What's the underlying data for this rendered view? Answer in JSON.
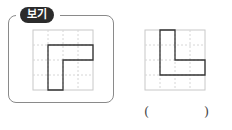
{
  "example_box": {
    "badge_label": "보기",
    "grid": {
      "cols": 4,
      "rows": 4,
      "cell_px": 15
    },
    "shape_cells_outline": "L-shape rotated: top bar spans cols 2-4 on row 2, vertical stem col 2 rows 2-4"
  },
  "question_figure": {
    "grid": {
      "cols": 4,
      "rows": 4,
      "cell_px": 15
    },
    "shape_cells_outline": "L-shape: vertical stem col 2 rows 1-3, bottom bar spans cols 2-4 on row 3"
  },
  "answer_blank": {
    "open_paren": "(",
    "close_paren": ")",
    "value": ""
  },
  "colors": {
    "grid_line": "#c8c8c8",
    "grid_dash": "#d6d6d6",
    "shape_line": "#333333",
    "badge_bg": "#2b2b2b",
    "frame": "#8a8a8a"
  }
}
